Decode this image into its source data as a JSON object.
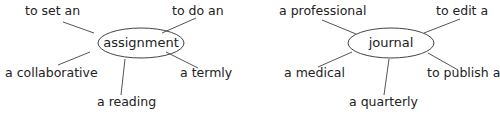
{
  "diagrams": [
    {
      "center": "assignment",
      "spokes": [
        "to set an",
        "to do an",
        "a collaborative",
        "a termly",
        "a reading"
      ]
    },
    {
      "center": "journal",
      "spokes": [
        "a professional",
        "to edit a",
        "a medical",
        "to publish a",
        "a quarterly"
      ]
    }
  ],
  "colors": {
    "line": "#555555",
    "text": "#222222",
    "ellipse": "#444444"
  }
}
